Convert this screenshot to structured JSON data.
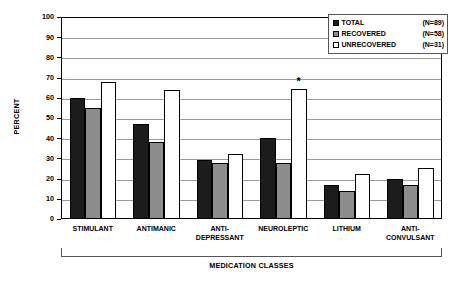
{
  "chart_data": {
    "type": "bar",
    "title": "",
    "xlabel": "MEDICATION CLASSES",
    "ylabel": "PERCENT",
    "ylim": [
      0,
      100
    ],
    "ytick_step": 10,
    "yticks": [
      100,
      90,
      80,
      70,
      60,
      50,
      40,
      30,
      20,
      10,
      0
    ],
    "grid": true,
    "legend_position": "top-right",
    "categories": [
      "STIMULANT",
      "ANTIMANIC",
      "ANTI-\nDEPRESSANT",
      "NEUROLEPTIC",
      "LITHIUM",
      "ANTI-\nCONVULSANT"
    ],
    "category_lines": [
      [
        "STIMULANT"
      ],
      [
        "ANTIMANIC"
      ],
      [
        "ANTI-",
        "DEPRESSANT"
      ],
      [
        "NEUROLEPTIC"
      ],
      [
        "LITHIUM"
      ],
      [
        "ANTI-",
        "CONVULSANT"
      ]
    ],
    "series": [
      {
        "name": "TOTAL",
        "n_label": "(N=89)",
        "color": "#1c1c1c",
        "values": [
          60,
          47,
          29,
          40,
          17,
          20
        ]
      },
      {
        "name": "RECOVERED",
        "n_label": "(N=58)",
        "color": "#8d8d8d",
        "values": [
          55,
          38,
          27.5,
          27.5,
          14,
          17
        ]
      },
      {
        "name": "UNRECOVERED",
        "n_label": "(N=31)",
        "color": "#ffffff",
        "values": [
          68,
          64,
          32,
          64.5,
          22.5,
          25.5
        ]
      }
    ],
    "annotations": [
      {
        "text": "*",
        "category": "NEUROLEPTIC",
        "series": "UNRECOVERED"
      }
    ]
  }
}
